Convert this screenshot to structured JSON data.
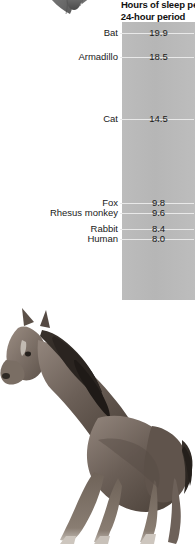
{
  "chart_data": {
    "type": "table",
    "title_line1": "Hours of sleep pe",
    "title_line2": "24-hour period",
    "xlabel": "",
    "ylabel": "Hours of sleep",
    "categories": [
      "Bat",
      "Armadillo",
      "Cat",
      "Fox",
      "Rhesus monkey",
      "Rabbit",
      "Human",
      "Cow",
      "Sheep",
      "Horse"
    ],
    "values": [
      19.9,
      18.5,
      14.5,
      9.8,
      9.6,
      8.4,
      8.0,
      3.9,
      3.8,
      2.9
    ],
    "value_labels": [
      "19.9",
      "18.5",
      "14.5",
      "9.8",
      "9.6",
      "8.4",
      "8.0",
      "3.9",
      "3.8",
      "2.9"
    ],
    "axis_orientation": "vertical-descending",
    "ylim": [
      0,
      21
    ],
    "grid": false,
    "legend": "none",
    "panel_color": "#b9b9b9",
    "text_color": "#1a1a1a",
    "background": "#ffffff"
  },
  "rows": [
    {
      "label": "Bat",
      "value": "19.9",
      "top": 27
    },
    {
      "label": "Armadillo",
      "value": "18.5",
      "top": 51
    },
    {
      "label": "Cat",
      "value": "14.5",
      "top": 113
    },
    {
      "label": "Fox",
      "value": "9.8",
      "top": 197
    },
    {
      "label": "Rhesus monkey",
      "value": "9.6",
      "top": 207
    },
    {
      "label": "Rabbit",
      "value": "8.4",
      "top": 223
    },
    {
      "label": "Human",
      "value": "8.0",
      "top": 233
    },
    {
      "label": "Cow",
      "value": "3.9",
      "top": 298
    },
    {
      "label": "Sheep",
      "value": "3.8",
      "top": 308
    },
    {
      "label": "Horse",
      "value": "2.9",
      "top": 318
    }
  ],
  "images": {
    "bat": "bat-photo",
    "horse": "horse-photo"
  }
}
